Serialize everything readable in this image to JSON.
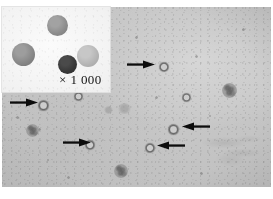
{
  "figure": {
    "width": 273,
    "height": 199,
    "background_color": "#ffffff",
    "field_color": "#c7c7c7"
  },
  "inset": {
    "name": "magnification-inset",
    "label": "× 1 000",
    "background_color": "#f4f4f4",
    "cells": [
      {
        "id": "inset-cell-top",
        "shade": "#8f8f8f",
        "x": 45,
        "y": 8,
        "d": 21
      },
      {
        "id": "inset-cell-left",
        "shade": "#8a8a8a",
        "x": 10,
        "y": 36,
        "d": 23
      },
      {
        "id": "inset-cell-dark",
        "shade": "#3a3a3a",
        "x": 56,
        "y": 48,
        "d": 19
      },
      {
        "id": "inset-cell-right",
        "shade": "#b4b4b4",
        "x": 75,
        "y": 38,
        "d": 22
      }
    ]
  },
  "field": {
    "name": "microscope-field",
    "arrows": [
      {
        "id": "arrow-1",
        "direction": "right",
        "x": 127,
        "y": 64,
        "length": 28,
        "points_to": "ring-cell-1"
      },
      {
        "id": "arrow-2",
        "direction": "right",
        "x": 10,
        "y": 103,
        "length": 28,
        "points_to": "ring-cell-2"
      },
      {
        "id": "arrow-3",
        "direction": "right",
        "x": 63,
        "y": 142,
        "length": 28,
        "points_to": "ring-cell-3"
      },
      {
        "id": "arrow-4",
        "direction": "left",
        "x": 182,
        "y": 127,
        "length": 28,
        "points_to": "ring-cell-4"
      },
      {
        "id": "arrow-5",
        "direction": "left",
        "x": 157,
        "y": 145,
        "length": 28,
        "points_to": "ring-cell-5"
      }
    ],
    "ring_cells": [
      {
        "id": "ring-cell-1",
        "x": 159,
        "y": 62,
        "d": 10
      },
      {
        "id": "ring-cell-2",
        "x": 38,
        "y": 100,
        "d": 11
      },
      {
        "id": "ring-cell-3",
        "x": 85,
        "y": 140,
        "d": 10
      },
      {
        "id": "ring-cell-4",
        "x": 168,
        "y": 124,
        "d": 11
      },
      {
        "id": "ring-cell-5",
        "x": 145,
        "y": 143,
        "d": 10
      },
      {
        "id": "ring-cell-6",
        "x": 74,
        "y": 92,
        "d": 9
      },
      {
        "id": "ring-cell-7",
        "x": 182,
        "y": 93,
        "d": 9
      }
    ],
    "granular_cells": [
      {
        "id": "granular-cell-1",
        "x": 222,
        "y": 83,
        "d": 15
      },
      {
        "id": "granular-cell-2",
        "x": 26,
        "y": 124,
        "d": 13
      },
      {
        "id": "granular-cell-3",
        "x": 114,
        "y": 164,
        "d": 14
      }
    ],
    "blur_blobs": [
      {
        "id": "blur-blob-1",
        "x": 118,
        "y": 103,
        "d": 13
      },
      {
        "id": "blur-blob-2",
        "x": 104,
        "y": 106,
        "d": 9
      }
    ],
    "specks": [
      {
        "id": "speck-1",
        "x": 16,
        "y": 116,
        "d": 3
      },
      {
        "id": "speck-2",
        "x": 38,
        "y": 128,
        "d": 3
      },
      {
        "id": "speck-3",
        "x": 155,
        "y": 96,
        "d": 3
      },
      {
        "id": "speck-4",
        "x": 242,
        "y": 28,
        "d": 3
      },
      {
        "id": "speck-5",
        "x": 200,
        "y": 172,
        "d": 3
      },
      {
        "id": "speck-6",
        "x": 67,
        "y": 176,
        "d": 3
      },
      {
        "id": "speck-7",
        "x": 135,
        "y": 36,
        "d": 3
      },
      {
        "id": "speck-8",
        "x": 195,
        "y": 55,
        "d": 3
      }
    ],
    "artifact": {
      "id": "fibre-artifact",
      "x": 196,
      "y": 122,
      "w": 70,
      "h": 46
    }
  }
}
